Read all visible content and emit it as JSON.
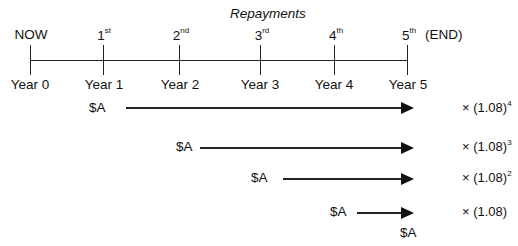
{
  "title": "Repayments",
  "timeline": {
    "top_labels": [
      {
        "num": "NOW",
        "sup": ""
      },
      {
        "num": "1",
        "sup": "st"
      },
      {
        "num": "2",
        "sup": "nd"
      },
      {
        "num": "3",
        "sup": "rd"
      },
      {
        "num": "4",
        "sup": "th"
      },
      {
        "num": "5",
        "sup": "th"
      }
    ],
    "end_label": "(END)",
    "bottom_labels": [
      "Year 0",
      "Year 1",
      "Year 2",
      "Year 3",
      "Year 4",
      "Year 5"
    ]
  },
  "flows": [
    {
      "amount": "$A",
      "factor": "× (1.08)",
      "exp": "4"
    },
    {
      "amount": "$A",
      "factor": "× (1.08)",
      "exp": "3"
    },
    {
      "amount": "$A",
      "factor": "× (1.08)",
      "exp": "2"
    },
    {
      "amount": "$A",
      "factor": "× (1.08)",
      "exp": ""
    }
  ],
  "final_amount": "$A"
}
